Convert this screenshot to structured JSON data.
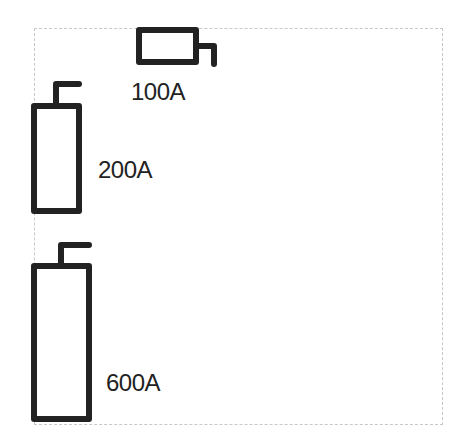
{
  "diagram": {
    "fuses": [
      {
        "rating": "100A",
        "orientation": "horizontal"
      },
      {
        "rating": "200A",
        "orientation": "vertical"
      },
      {
        "rating": "600A",
        "orientation": "vertical"
      }
    ],
    "colors": {
      "stroke": "#222222",
      "frame": "#c8c8c8",
      "background": "#ffffff"
    }
  }
}
